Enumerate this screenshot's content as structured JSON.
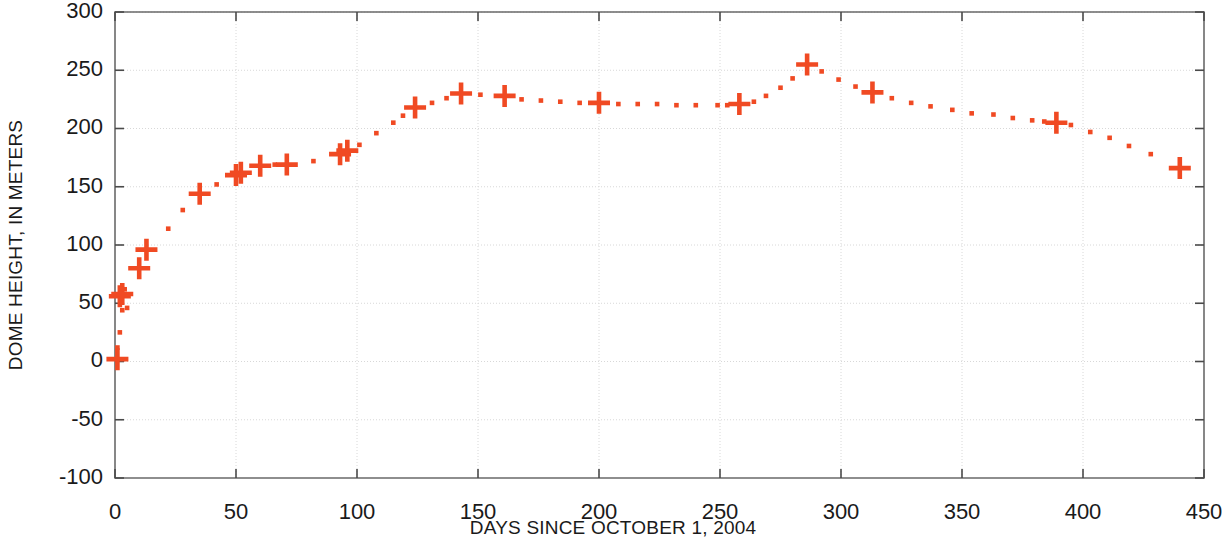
{
  "chart_data": {
    "type": "scatter",
    "title": "",
    "xlabel": "DAYS SINCE OCTOBER 1, 2004",
    "ylabel": "DOME HEIGHT, IN METERS",
    "xlim": [
      0,
      450
    ],
    "ylim": [
      -100,
      300
    ],
    "xticks": [
      0,
      50,
      100,
      150,
      200,
      250,
      300,
      350,
      400,
      450
    ],
    "yticks": [
      -100,
      -50,
      0,
      50,
      100,
      150,
      200,
      250,
      300
    ],
    "xtick_labels": [
      "0",
      "50",
      "100",
      "150",
      "200",
      "250",
      "300",
      "350",
      "400",
      "450"
    ],
    "ytick_labels": [
      "-100",
      "-50",
      "0",
      "50",
      "100",
      "150",
      "200",
      "250",
      "300"
    ],
    "grid": true,
    "grid_color": "#d8d8d8",
    "legend": "none",
    "marker_color": "#f04a23",
    "series": [
      {
        "name": "Measured dome height (large plus markers)",
        "marker": "plus-large",
        "points": [
          [
            1,
            2
          ],
          [
            2,
            56
          ],
          [
            3,
            58
          ],
          [
            10,
            80
          ],
          [
            13,
            96
          ],
          [
            35,
            144
          ],
          [
            50,
            160
          ],
          [
            52,
            162
          ],
          [
            60,
            168
          ],
          [
            71,
            169
          ],
          [
            93,
            178
          ],
          [
            96,
            181
          ],
          [
            124,
            218
          ],
          [
            143,
            230
          ],
          [
            161,
            228
          ],
          [
            200,
            222
          ],
          [
            258,
            221
          ],
          [
            286,
            255
          ],
          [
            313,
            231
          ],
          [
            389,
            205
          ],
          [
            440,
            166
          ]
        ]
      },
      {
        "name": "Interpolated dome height (small dot markers)",
        "marker": "dot-small",
        "points": [
          [
            1,
            12
          ],
          [
            2,
            25
          ],
          [
            3,
            44
          ],
          [
            4,
            62
          ],
          [
            5,
            46
          ],
          [
            22,
            114
          ],
          [
            28,
            130
          ],
          [
            42,
            152
          ],
          [
            66,
            169
          ],
          [
            82,
            172
          ],
          [
            101,
            186
          ],
          [
            108,
            196
          ],
          [
            115,
            205
          ],
          [
            119,
            211
          ],
          [
            131,
            222
          ],
          [
            137,
            226
          ],
          [
            151,
            229
          ],
          [
            168,
            225
          ],
          [
            176,
            224
          ],
          [
            184,
            223
          ],
          [
            192,
            222
          ],
          [
            208,
            221
          ],
          [
            216,
            221
          ],
          [
            224,
            221
          ],
          [
            232,
            220
          ],
          [
            240,
            220
          ],
          [
            249,
            220
          ],
          [
            253,
            220
          ],
          [
            264,
            223
          ],
          [
            269,
            228
          ],
          [
            275,
            235
          ],
          [
            280,
            243
          ],
          [
            292,
            249
          ],
          [
            299,
            242
          ],
          [
            306,
            236
          ],
          [
            321,
            226
          ],
          [
            329,
            222
          ],
          [
            337,
            219
          ],
          [
            346,
            216
          ],
          [
            354,
            213
          ],
          [
            363,
            212
          ],
          [
            371,
            209
          ],
          [
            379,
            207
          ],
          [
            384,
            206
          ],
          [
            395,
            203
          ],
          [
            403,
            197
          ],
          [
            411,
            192
          ],
          [
            419,
            185
          ],
          [
            428,
            178
          ]
        ]
      }
    ]
  },
  "axis": {
    "x_title": "DAYS SINCE OCTOBER 1, 2004",
    "y_title": "DOME HEIGHT, IN METERS"
  }
}
